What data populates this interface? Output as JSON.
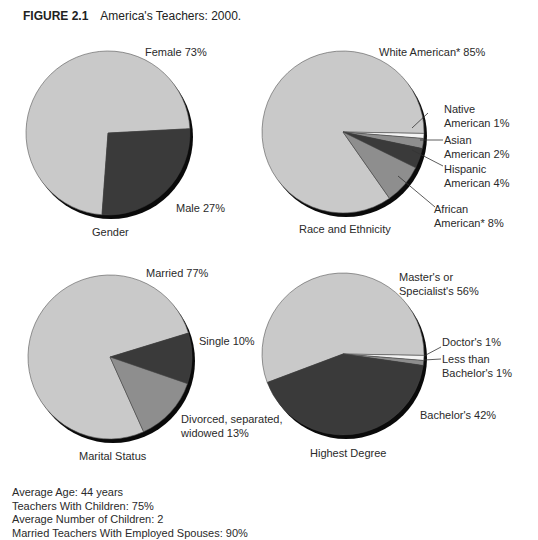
{
  "figure": {
    "number": "FIGURE 2.1",
    "title": "America's Teachers: 2000."
  },
  "colors": {
    "light": "#c9c9c9",
    "medium": "#8e8e8e",
    "dark": "#3a3a3a",
    "white": "#f4f4f4",
    "shadow": "#0a0a0a"
  },
  "chart_data": [
    {
      "type": "pie",
      "title": "Gender",
      "labels": [
        "Female",
        "Male"
      ],
      "values": [
        73,
        27
      ],
      "label_text": [
        "Female 73%",
        "Male 27%"
      ]
    },
    {
      "type": "pie",
      "title": "Race and Ethnicity",
      "labels": [
        "White American*",
        "Native American",
        "Asian American",
        "Hispanic American",
        "African American*"
      ],
      "values": [
        85,
        1,
        2,
        4,
        8
      ],
      "label_text": [
        "White American* 85%",
        "Native\nAmerican 1%",
        "Asian\nAmerican 2%",
        "Hispanic\nAmerican 4%",
        "African\nAmerican* 8%"
      ]
    },
    {
      "type": "pie",
      "title": "Marital Status",
      "labels": [
        "Married",
        "Single",
        "Divorced, separated, widowed"
      ],
      "values": [
        77,
        10,
        13
      ],
      "label_text": [
        "Married 77%",
        "Single 10%",
        "Divorced, separated,\nwidowed 13%"
      ]
    },
    {
      "type": "pie",
      "title": "Highest Degree",
      "labels": [
        "Master's or Specialist's",
        "Doctor's",
        "Less than Bachelor's",
        "Bachelor's"
      ],
      "values": [
        56,
        1,
        1,
        42
      ],
      "label_text": [
        "Master's or\nSpecialist's 56%",
        "Doctor's 1%",
        "Less than\nBachelor's 1%",
        "Bachelor's 42%"
      ]
    }
  ],
  "stats": [
    "Average Age: 44 years",
    "Teachers With Children: 75%",
    "Average Number of Children: 2",
    "Married Teachers With Employed Spouses: 90%"
  ]
}
